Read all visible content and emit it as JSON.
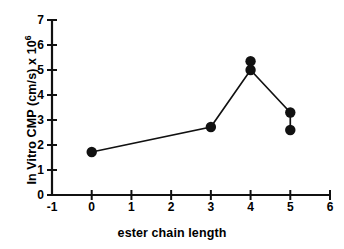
{
  "chart_data": {
    "type": "scatter",
    "title": "",
    "xlabel": "ester chain length",
    "ylabel": "In Vitro CMP  (cm/s)  x 10",
    "ylabel_exponent": "6",
    "xlim": [
      -1,
      6
    ],
    "ylim": [
      0,
      7
    ],
    "xticks": [
      "-1",
      "0",
      "1",
      "2",
      "3",
      "4",
      "5",
      "6"
    ],
    "yticks": [
      "0",
      "1",
      "2",
      "3",
      "4",
      "5",
      "6",
      "7"
    ],
    "grid": false,
    "legend": null,
    "marker": "filled-circle",
    "marker_color": "#111111",
    "line_color": "#111111",
    "series": [
      {
        "name": "In Vitro CMP",
        "points": [
          {
            "x": 0,
            "y": 1.72
          },
          {
            "x": 3,
            "y": 2.72
          },
          {
            "x": 4,
            "y": 5.35
          },
          {
            "x": 4,
            "y": 5.0
          },
          {
            "x": 5,
            "y": 3.3
          },
          {
            "x": 5,
            "y": 2.6
          }
        ],
        "connected_path": [
          {
            "x": 0,
            "y": 1.72
          },
          {
            "x": 3,
            "y": 2.72
          },
          {
            "x": 4,
            "y": 5.0
          },
          {
            "x": 5,
            "y": 3.3
          }
        ],
        "vertical_pairs": [
          {
            "x": 4,
            "y_low": 5.0,
            "y_high": 5.35
          },
          {
            "x": 5,
            "y_low": 2.6,
            "y_high": 3.3
          }
        ]
      }
    ]
  }
}
